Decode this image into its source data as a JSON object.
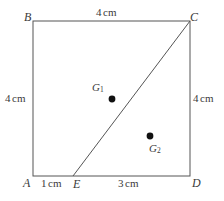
{
  "figure": {
    "type": "geometry-diagram",
    "shape": "square-with-diagonal-segment",
    "background_color": "#ffffff",
    "stroke_color": "#555555",
    "text_color": "#3a3a3a",
    "dot_color": "#111111"
  },
  "vertices": [
    {
      "id": "B",
      "label": "B",
      "corner": "top-left"
    },
    {
      "id": "C",
      "label": "C",
      "corner": "top-right"
    },
    {
      "id": "A",
      "label": "A",
      "corner": "bottom-left"
    },
    {
      "id": "D",
      "label": "D",
      "corner": "bottom-right"
    },
    {
      "id": "E",
      "label": "E",
      "corner": "bottom-edge-point"
    }
  ],
  "points": [
    {
      "id": "G1",
      "letter": "G",
      "subscript": "1"
    },
    {
      "id": "G2",
      "letter": "G",
      "subscript": "2"
    }
  ],
  "dimensions": [
    {
      "id": "top",
      "value": "4",
      "unit": "cm",
      "side": "BC"
    },
    {
      "id": "left",
      "value": "4",
      "unit": "cm",
      "side": "AB"
    },
    {
      "id": "right",
      "value": "4",
      "unit": "cm",
      "side": "CD"
    },
    {
      "id": "bottom-left",
      "value": "1",
      "unit": "cm",
      "side": "AE"
    },
    {
      "id": "bottom-right",
      "value": "3",
      "unit": "cm",
      "side": "ED"
    }
  ],
  "geometry": {
    "square": {
      "x": 33,
      "y": 21,
      "width": 157,
      "height": 155
    },
    "segment_EC": {
      "x1": 73,
      "y1": 176,
      "x2": 190,
      "y2": 21
    },
    "dots": [
      {
        "id": "G1",
        "cx": 112,
        "cy": 99,
        "r": 3.4
      },
      {
        "id": "G2",
        "cx": 150,
        "cy": 136,
        "r": 3.4
      }
    ]
  }
}
